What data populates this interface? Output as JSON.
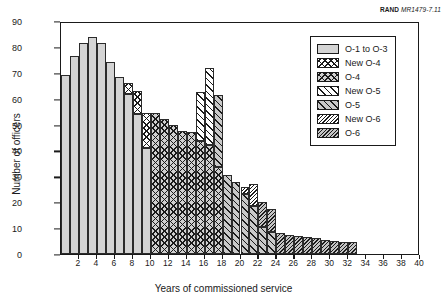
{
  "credit": {
    "org": "RAND",
    "doc_id": "MR1479-7.11"
  },
  "chart_data": {
    "type": "bar",
    "stacked": true,
    "title": "",
    "xlabel": "Years of commissioned service",
    "ylabel": "Number of officers",
    "xlim": [
      0,
      40
    ],
    "ylim": [
      0,
      90
    ],
    "ytick_step": 10,
    "xtick_step": 2,
    "grid": false,
    "legend_position": "top-right",
    "yticks": [
      "0",
      "10",
      "20",
      "30",
      "40",
      "50",
      "60",
      "70",
      "80",
      "90"
    ],
    "xticks": [
      "2",
      "4",
      "6",
      "8",
      "10",
      "12",
      "14",
      "16",
      "18",
      "20",
      "22",
      "24",
      "26",
      "28",
      "30",
      "32",
      "34",
      "36",
      "38",
      "40"
    ],
    "categories": [
      1,
      2,
      3,
      4,
      5,
      6,
      7,
      8,
      9,
      10,
      11,
      12,
      13,
      14,
      15,
      16,
      17,
      18,
      19,
      20,
      21,
      22,
      23,
      24,
      25,
      26,
      27,
      28,
      29,
      30,
      31,
      32,
      33,
      34,
      35,
      36,
      37,
      38,
      39,
      40
    ],
    "series": [
      {
        "name": "O-1 to O-3",
        "key": "o13",
        "pattern": "solid-light-gray",
        "color": "#d4d4d4",
        "values": [
          69,
          76.5,
          81.5,
          84,
          81.5,
          74,
          68.5,
          62,
          54,
          41,
          0,
          0,
          0,
          0,
          0,
          0,
          0,
          0,
          0,
          0,
          0,
          0,
          0,
          0,
          0,
          0,
          0,
          0,
          0,
          0,
          0,
          0,
          0,
          0,
          0,
          0,
          0,
          0,
          0,
          0
        ]
      },
      {
        "name": "New O-4",
        "key": "newo4",
        "pattern": "cross-hatch-white",
        "color": "#ffffff",
        "values": [
          0,
          0,
          0,
          0,
          0,
          0,
          0,
          4,
          9,
          13.5,
          0,
          0,
          0,
          0,
          0,
          0,
          0,
          0,
          0,
          0,
          0,
          0,
          0,
          0,
          0,
          0,
          0,
          0,
          0,
          0,
          0,
          0,
          0,
          0,
          0,
          0,
          0,
          0,
          0,
          0
        ]
      },
      {
        "name": "O-4",
        "key": "o4",
        "pattern": "cross-hatch-gray",
        "color": "#d0d0d0",
        "values": [
          0,
          0,
          0,
          0,
          0,
          0,
          0,
          0,
          0,
          0,
          54.5,
          52,
          50,
          47.5,
          47,
          43.5,
          42,
          33.5,
          0,
          0,
          0,
          0,
          0,
          0,
          0,
          0,
          0,
          0,
          0,
          0,
          0,
          0,
          0,
          0,
          0,
          0,
          0,
          0,
          0,
          0
        ]
      },
      {
        "name": "New O-5",
        "key": "newo5",
        "pattern": "diagonal-white",
        "color": "#ffffff",
        "values": [
          0,
          0,
          0,
          0,
          0,
          0,
          0,
          0,
          0,
          0,
          0,
          0,
          0,
          0,
          0,
          19,
          30,
          0,
          0,
          0,
          0,
          0,
          0,
          0,
          0,
          0,
          0,
          0,
          0,
          0,
          0,
          0,
          0,
          0,
          0,
          0,
          0,
          0,
          0,
          0
        ]
      },
      {
        "name": "O-5",
        "key": "o5",
        "pattern": "diagonal-gray",
        "color": "#c9c9c9",
        "values": [
          0,
          0,
          0,
          0,
          0,
          0,
          0,
          0,
          0,
          0,
          0,
          0,
          0,
          0,
          0,
          0,
          0,
          28,
          30.5,
          28,
          23,
          18.5,
          10.5,
          8.5,
          0,
          0,
          0,
          0,
          0,
          0,
          0,
          0,
          0,
          0,
          0,
          0,
          0,
          0,
          0,
          0
        ]
      },
      {
        "name": "New O-6",
        "key": "newo6",
        "pattern": "fine-hatch-white",
        "color": "#ffffff",
        "values": [
          0,
          0,
          0,
          0,
          0,
          0,
          0,
          0,
          0,
          0,
          0,
          0,
          0,
          0,
          0,
          0,
          0,
          0,
          0,
          0,
          3,
          8.5,
          0,
          0,
          0,
          0,
          0,
          0,
          0,
          0,
          0,
          0,
          0,
          0,
          0,
          0,
          0,
          0,
          0,
          0
        ]
      },
      {
        "name": "O-6",
        "key": "o6",
        "pattern": "fine-hatch-gray",
        "color": "#c4c4c4",
        "values": [
          0,
          0,
          0,
          0,
          0,
          0,
          0,
          0,
          0,
          0,
          0,
          0,
          0,
          0,
          0,
          0,
          0,
          0,
          0,
          0,
          0,
          0,
          9.5,
          9,
          8,
          7.5,
          7,
          6.5,
          6,
          5.5,
          5,
          4.5,
          4.5,
          0,
          0,
          0,
          0,
          0,
          0,
          0
        ]
      }
    ]
  },
  "legend": {
    "items": [
      {
        "label": "O-1 to O-3",
        "key": "o13"
      },
      {
        "label": "New O-4",
        "key": "newo4"
      },
      {
        "label": "O-4",
        "key": "o4"
      },
      {
        "label": "New O-5",
        "key": "newo5"
      },
      {
        "label": "O-5",
        "key": "o5"
      },
      {
        "label": "New O-6",
        "key": "newo6"
      },
      {
        "label": "O-6",
        "key": "o6"
      }
    ]
  }
}
